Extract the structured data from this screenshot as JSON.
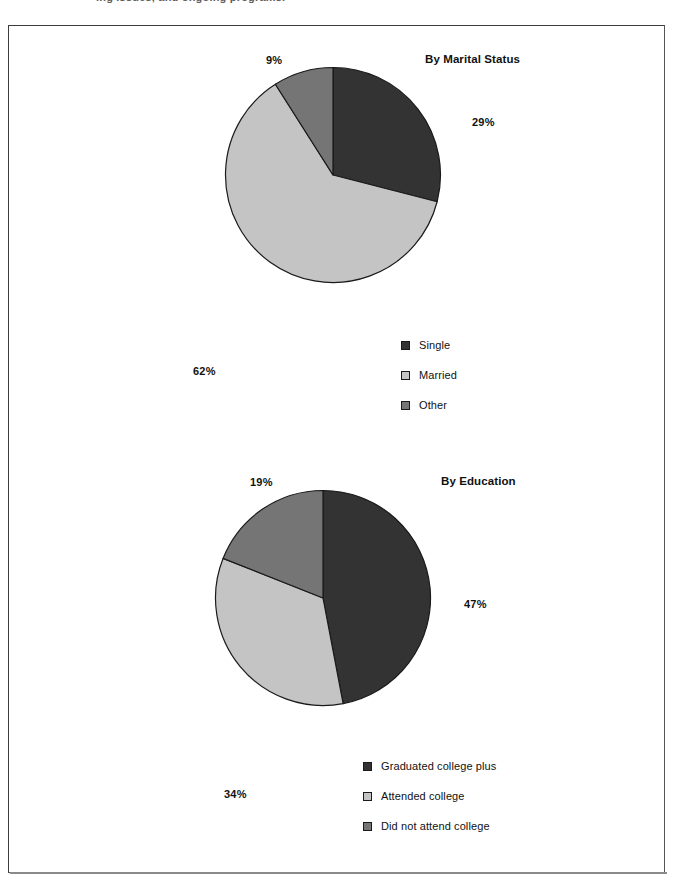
{
  "page": {
    "top_caption": "ing issues, and ongoing programs.",
    "frame_color": "#3c3c3c",
    "background": "#ffffff"
  },
  "palette": {
    "dark": "#333333",
    "light": "#c4c4c4",
    "medium": "#757575",
    "outline": "#1a1a1a"
  },
  "chart_data": [
    {
      "type": "pie",
      "id": "by-marital-status",
      "title": "By Marital Status",
      "categories": [
        "Single",
        "Married",
        "Other"
      ],
      "values": [
        29,
        62,
        9
      ],
      "value_labels": [
        "29%",
        "62%",
        "9%"
      ],
      "colors": [
        "#333333",
        "#c4c4c4",
        "#757575"
      ],
      "legend_position": "bottom-right",
      "start_angle": 0,
      "direction": "clockwise",
      "units": "percent",
      "xlabel": "",
      "ylabel": ""
    },
    {
      "type": "pie",
      "id": "by-education",
      "title": "By Education",
      "categories": [
        "Graduated college plus",
        "Attended college",
        "Did not attend college"
      ],
      "values": [
        47,
        34,
        19
      ],
      "value_labels": [
        "47%",
        "34%",
        "19%"
      ],
      "colors": [
        "#333333",
        "#c4c4c4",
        "#757575"
      ],
      "legend_position": "bottom-right",
      "start_angle": 0,
      "direction": "clockwise",
      "units": "percent",
      "xlabel": "",
      "ylabel": ""
    }
  ]
}
